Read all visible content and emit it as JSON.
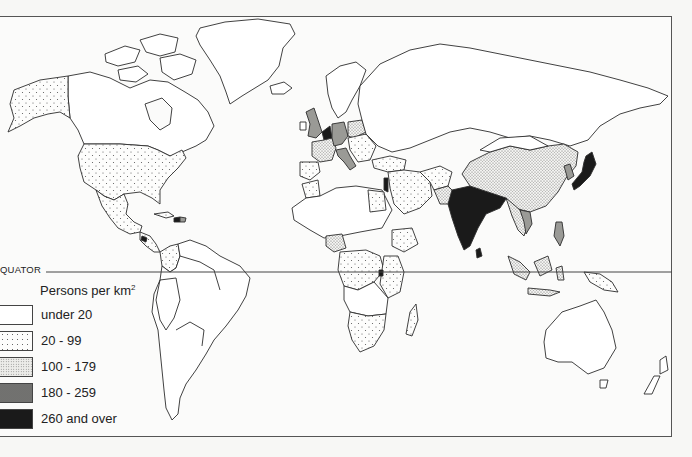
{
  "map": {
    "subject": "World population density",
    "equator_label": "QUATOR",
    "fill_colors": {
      "under_20": "#ffffff",
      "20_99": "#f1f1ef",
      "100_179": "#d9d9d6",
      "180_259": "#9a9a96",
      "260_over": "#1a1a1a",
      "outline": "#333333",
      "frame": "#555555"
    }
  },
  "legend": {
    "title": "Persons per km",
    "title_superscript": "2",
    "items": [
      {
        "label": "under 20",
        "class": "under_20"
      },
      {
        "label": "20 - 99",
        "class": "20_99"
      },
      {
        "label": "100 - 179",
        "class": "100_179"
      },
      {
        "label": "180 - 259",
        "class": "180_259"
      },
      {
        "label": "260 and over",
        "class": "260_over"
      }
    ]
  },
  "regions": [
    {
      "name": "Alaska (USA)",
      "class": "20_99"
    },
    {
      "name": "Canada",
      "class": "under_20"
    },
    {
      "name": "Greenland",
      "class": "under_20"
    },
    {
      "name": "USA",
      "class": "20_99"
    },
    {
      "name": "Mexico",
      "class": "20_99"
    },
    {
      "name": "Central America",
      "class": "20_99"
    },
    {
      "name": "Caribbean",
      "class": "180_259"
    },
    {
      "name": "Colombia",
      "class": "20_99"
    },
    {
      "name": "South America",
      "class": "under_20"
    },
    {
      "name": "United Kingdom",
      "class": "180_259"
    },
    {
      "name": "Benelux",
      "class": "260_over"
    },
    {
      "name": "Germany",
      "class": "180_259"
    },
    {
      "name": "France",
      "class": "100_179"
    },
    {
      "name": "Italy",
      "class": "180_259"
    },
    {
      "name": "Iberia",
      "class": "20_99"
    },
    {
      "name": "Poland",
      "class": "100_179"
    },
    {
      "name": "Scandinavia",
      "class": "under_20"
    },
    {
      "name": "Eastern Europe",
      "class": "20_99"
    },
    {
      "name": "Russia / USSR",
      "class": "under_20"
    },
    {
      "name": "Turkey",
      "class": "20_99"
    },
    {
      "name": "Middle East",
      "class": "20_99"
    },
    {
      "name": "Israel",
      "class": "260_over"
    },
    {
      "name": "Egypt",
      "class": "20_99"
    },
    {
      "name": "Saharan Africa",
      "class": "under_20"
    },
    {
      "name": "Morocco",
      "class": "20_99"
    },
    {
      "name": "Nigeria",
      "class": "100_179"
    },
    {
      "name": "Ethiopia",
      "class": "20_99"
    },
    {
      "name": "East Africa",
      "class": "20_99"
    },
    {
      "name": "Rwanda/Burundi",
      "class": "260_over"
    },
    {
      "name": "Central Africa",
      "class": "under_20"
    },
    {
      "name": "Southern Africa",
      "class": "20_99"
    },
    {
      "name": "Madagascar",
      "class": "20_99"
    },
    {
      "name": "Pakistan",
      "class": "100_179"
    },
    {
      "name": "Afghanistan",
      "class": "20_99"
    },
    {
      "name": "India",
      "class": "260_over"
    },
    {
      "name": "China",
      "class": "100_179"
    },
    {
      "name": "Mongolia",
      "class": "under_20"
    },
    {
      "name": "Korea",
      "class": "180_259"
    },
    {
      "name": "Japan",
      "class": "260_over"
    },
    {
      "name": "Southeast Asia",
      "class": "100_179"
    },
    {
      "name": "Vietnam",
      "class": "180_259"
    },
    {
      "name": "Philippines",
      "class": "180_259"
    },
    {
      "name": "Indonesia",
      "class": "100_179"
    },
    {
      "name": "New Guinea",
      "class": "20_99"
    },
    {
      "name": "Australia",
      "class": "under_20"
    },
    {
      "name": "New Zealand",
      "class": "under_20"
    }
  ]
}
